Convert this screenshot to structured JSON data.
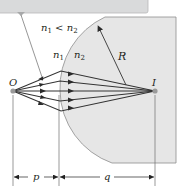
{
  "figure": {
    "type": "refraction-at-spherical-surface",
    "condition": {
      "n1": "n",
      "sub1": "1",
      "relation": " < ",
      "n2": "n",
      "sub2": "2"
    },
    "medium1_label": {
      "text": "n",
      "sub": "1"
    },
    "medium2_label": {
      "text": "n",
      "sub": "2"
    },
    "object_label": "O",
    "image_label": "I",
    "radius_label": "R",
    "object_distance_label": "p",
    "image_distance_label": "q",
    "colors": {
      "medium2_fill": "#e6e6e6",
      "callout_fill": "#d9dadb",
      "ray_color": "#3a3a3a",
      "point_color": "#9a9a9a",
      "line_color": "#7a7a7a"
    }
  }
}
